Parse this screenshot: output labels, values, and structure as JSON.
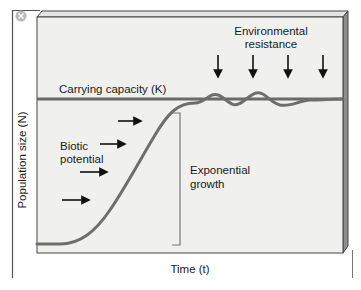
{
  "figure": {
    "type": "logistic-growth-diagram",
    "y_axis_label": "Population size (N)",
    "x_axis_label": "Time (t)",
    "labels": {
      "carrying_capacity": "Carrying capacity (K)",
      "environmental_resistance_line1": "Environmental",
      "environmental_resistance_line2": "resistance",
      "biotic_potential_line1": "Biotic",
      "biotic_potential_line2": "potential",
      "exponential_growth_line1": "Exponential",
      "exponential_growth_line2": "growth"
    },
    "close_icon": "close-circle-icon",
    "colors": {
      "panel": "#f0f0ef",
      "panel_side": "#8f8f8f",
      "curve": "#6e6e6e",
      "capacity_line": "#6a6a6a",
      "arrow": "#111111",
      "frame": "#555555"
    },
    "arrow_counts": {
      "environmental_resistance": 4,
      "biotic_potential": 4
    }
  }
}
